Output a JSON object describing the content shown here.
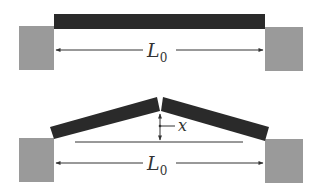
{
  "figure": {
    "top": {
      "length_label": "L",
      "length_subscript": "0",
      "description": "Straight beam between two supports"
    },
    "bottom": {
      "length_label": "L",
      "length_subscript": "0",
      "displacement_label": "x",
      "description": "Buckled beam with midpoint displaced upward by x"
    },
    "colors": {
      "beam": "#2a2a2a",
      "support": "#9a9a9a",
      "line": "#333333",
      "background": "#ffffff"
    }
  }
}
